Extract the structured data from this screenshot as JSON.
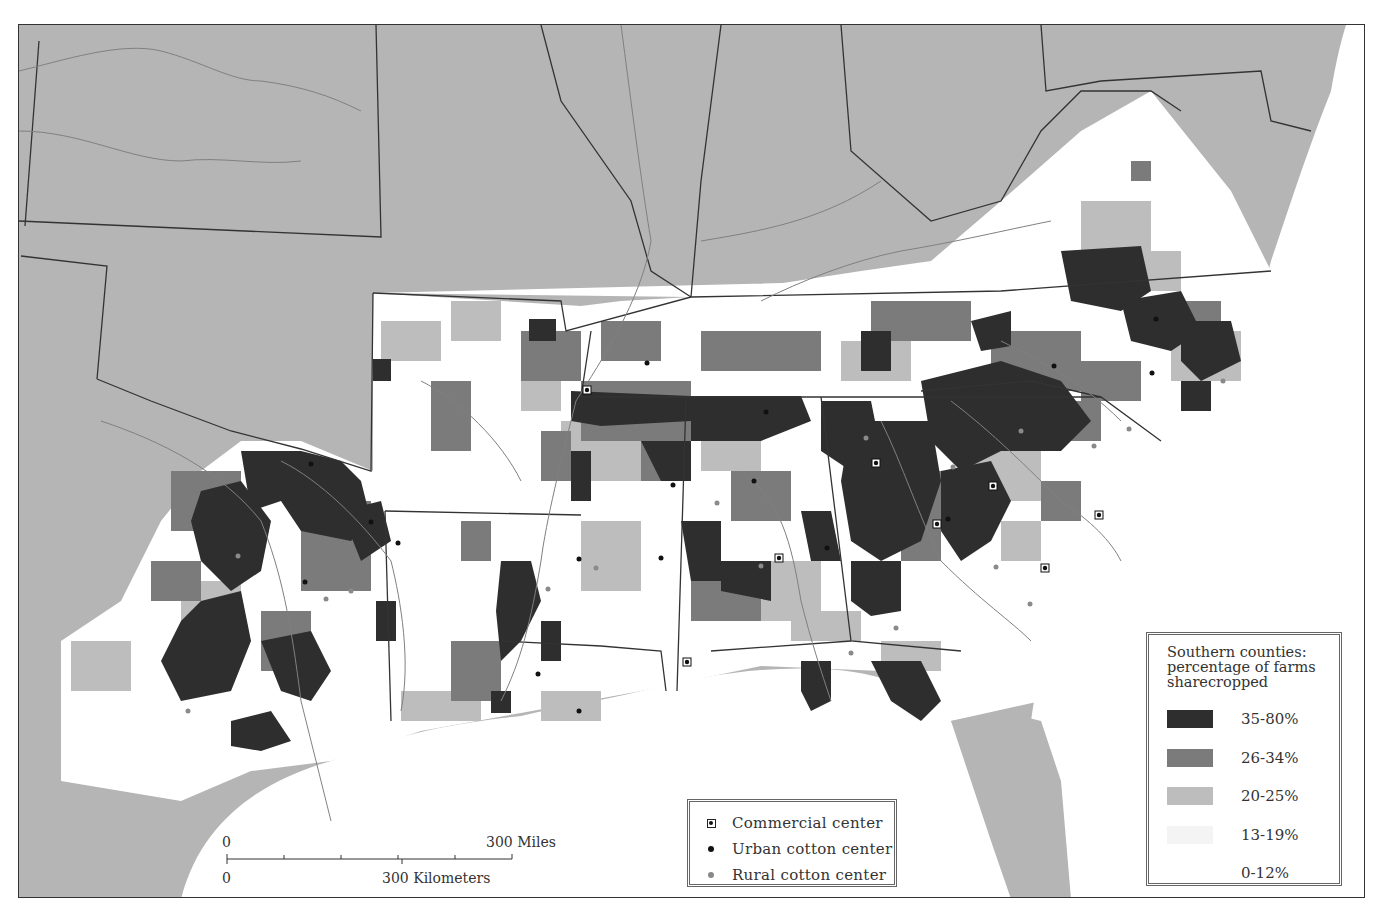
{
  "map": {
    "subject": "Southern United States sharecropping by county",
    "colors": {
      "background_states": "#b5b5b5",
      "class_35_80": "#2e2e2e",
      "class_26_34": "#7b7b7b",
      "class_20_25": "#bdbdbd",
      "class_13_19": "#e4e4e4",
      "class_0_12": "#ffffff",
      "boundary": "#333333",
      "river": "#7d7d7d"
    }
  },
  "legend_share": {
    "title": "Southern counties: percentage of farms sharecropped",
    "title_lines": [
      "Southern counties:",
      "percentage of farms",
      "sharecropped"
    ],
    "classes": [
      {
        "label": "35-80%",
        "color": "#2e2e2e"
      },
      {
        "label": "26-34%",
        "color": "#7b7b7b"
      },
      {
        "label": "20-25%",
        "color": "#bdbdbd"
      },
      {
        "label": "13-19%",
        "color": "#ececec"
      },
      {
        "label": "0-12%",
        "color": "#ffffff"
      }
    ]
  },
  "legend_points": {
    "items": [
      {
        "label": "Commercial center",
        "symbol": "square-dot-icon"
      },
      {
        "label": "Urban cotton center",
        "symbol": "black-dot-icon"
      },
      {
        "label": "Rural cotton center",
        "symbol": "gray-dot-icon"
      }
    ]
  },
  "scale_bar": {
    "miles_zero": "0",
    "miles_label": "300 Miles",
    "km_zero": "0",
    "km_label": "300 Kilometers"
  }
}
